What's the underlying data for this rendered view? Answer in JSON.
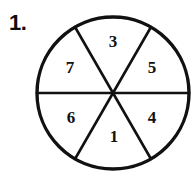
{
  "figure": {
    "item_number": "1.",
    "shape": "circle-divided-into-six-sectors",
    "background_color": "#ffffff",
    "stroke_color": "#111111",
    "label_color": "#111111",
    "circle": {
      "center_x": 113,
      "center_y": 93,
      "radius": 76,
      "outline_width": 3.4
    },
    "dividers": [
      {
        "name": "horizontal-diameter",
        "angle_deg": 0
      },
      {
        "name": "diameter-60deg",
        "angle_deg": 60
      },
      {
        "name": "diameter-120deg",
        "angle_deg": 120
      }
    ],
    "sectors": [
      {
        "name": "sector-top",
        "label": "3",
        "x": 113,
        "y": 43,
        "angle_center_deg": 90
      },
      {
        "name": "sector-upper-right",
        "label": "5",
        "x": 152,
        "y": 69,
        "angle_center_deg": 30
      },
      {
        "name": "sector-lower-right",
        "label": "4",
        "x": 152,
        "y": 119,
        "angle_center_deg": -30
      },
      {
        "name": "sector-bottom",
        "label": "1",
        "x": 114,
        "y": 138,
        "angle_center_deg": -90
      },
      {
        "name": "sector-lower-left",
        "label": "6",
        "x": 71,
        "y": 119,
        "angle_center_deg": -150
      },
      {
        "name": "sector-upper-left",
        "label": "7",
        "x": 70,
        "y": 69,
        "angle_center_deg": 150
      }
    ]
  }
}
